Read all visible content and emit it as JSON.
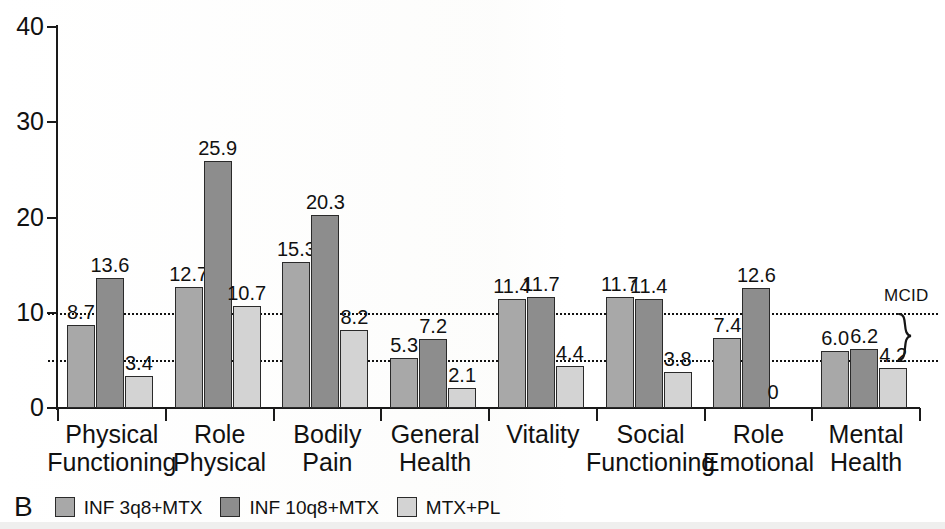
{
  "panel": {
    "letter": "B"
  },
  "chart_data": {
    "type": "bar",
    "title": "",
    "subtitle": "",
    "xlabel": "",
    "ylabel": "",
    "ylim": [
      0,
      40
    ],
    "yticks": [
      0,
      10,
      20,
      30,
      40
    ],
    "grid": false,
    "legend_position": "bottom",
    "categories": [
      "Physical Functioning",
      "Role Physical",
      "Bodily Pain",
      "General Health",
      "Vitality",
      "Social Functioning",
      "Role Emotional",
      "Mental Health"
    ],
    "category_lines": [
      [
        "Physical",
        "Functioning"
      ],
      [
        "Role",
        "Physical"
      ],
      [
        "Bodily",
        "Pain"
      ],
      [
        "General",
        "Health"
      ],
      [
        "Vitality",
        ""
      ],
      [
        "Social",
        "Functioning"
      ],
      [
        "Role",
        "Emotional"
      ],
      [
        "Mental",
        "Health"
      ]
    ],
    "series": [
      {
        "name": "INF 3q8+MTX",
        "color": "#a8a8a8",
        "values": [
          8.7,
          12.7,
          15.3,
          5.3,
          11.4,
          11.7,
          7.4,
          6.0
        ],
        "labels": [
          "8.7",
          "12.7",
          "15.3",
          "5.3",
          "11.4",
          "11.7",
          "7.4",
          "6.0"
        ]
      },
      {
        "name": "INF 10q8+MTX",
        "color": "#8d8d8d",
        "values": [
          13.6,
          25.9,
          20.3,
          7.2,
          11.7,
          11.4,
          12.6,
          6.2
        ],
        "labels": [
          "13.6",
          "25.9",
          "20.3",
          "7.2",
          "11.7",
          "11.4",
          "12.6",
          "6.2"
        ]
      },
      {
        "name": "MTX+PL",
        "color": "#d3d3d3",
        "values": [
          3.4,
          10.7,
          8.2,
          2.1,
          4.4,
          3.8,
          0,
          4.2
        ],
        "labels": [
          "3.4",
          "10.7",
          "8.2",
          "2.1",
          "4.4",
          "3.8",
          "0",
          "4.2"
        ]
      }
    ],
    "reference_lines": [
      {
        "value": 10,
        "style": "dotted"
      },
      {
        "value": 5,
        "style": "dotted"
      }
    ],
    "annotations": [
      {
        "text": "MCID",
        "target": "bracket spanning 5 to 10 on y-axis, right side"
      }
    ]
  },
  "legend": {
    "items": [
      {
        "label": "INF 3q8+MTX",
        "color": "#a8a8a8"
      },
      {
        "label": "INF 10q8+MTX",
        "color": "#8d8d8d"
      },
      {
        "label": "MTX+PL",
        "color": "#d3d3d3"
      }
    ]
  },
  "annotation": {
    "mcid_label": "MCID"
  }
}
